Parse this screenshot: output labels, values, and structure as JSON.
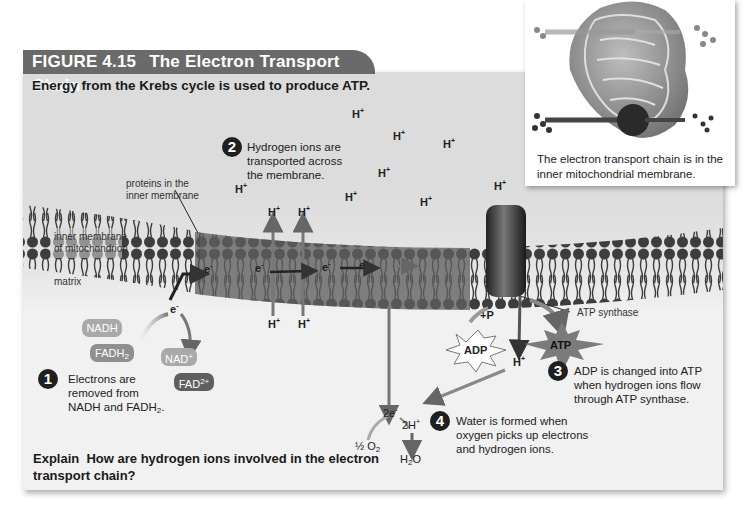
{
  "figure": {
    "number": "FIGURE 4.15",
    "title": "The Electron Transport Chain",
    "subtitle": "Energy from the Krebs cycle is used to produce ATP.",
    "header_color": "#6a6a6a",
    "panel_color_top": "#dcdcdc",
    "panel_color_bottom": "#f1f1f1"
  },
  "inset": {
    "caption_line1": "The electron transport chain is in the",
    "caption_line2": "inner mitochondrial membrane."
  },
  "labels": {
    "proteins_line1": "proteins in the",
    "proteins_line2": "inner membrane",
    "inner_membrane_line1": "inner membrane",
    "inner_membrane_line2": "of mitochondrion",
    "matrix": "matrix",
    "atp_synthase": "ATP synthase",
    "h_ion": "H",
    "h_charge": "+",
    "electron": "e",
    "electron_charge": "-",
    "adp": "ADP",
    "atp": "ATP",
    "plus_p": "+P",
    "two_e": "2e",
    "two_h": "2H",
    "half": "½",
    "o2": "O",
    "o2_sub": "2",
    "h2o_h": "H",
    "h2o_sub": "2",
    "h2o_o": "O"
  },
  "molecules": {
    "nadh": {
      "label": "NADH",
      "color": "#a9a9a9"
    },
    "fadh2": {
      "label": "FADH",
      "sub": "2",
      "color": "#8f8f8f"
    },
    "nad": {
      "label": "NAD",
      "sup": "+",
      "color": "#a9a9a9"
    },
    "fad": {
      "label": "FAD",
      "sup": "2+",
      "color": "#5f5f5f"
    }
  },
  "steps": [
    {
      "num": "1",
      "lines": [
        "Electrons are",
        "removed from",
        "NADH and FADH"
      ],
      "line3_sub": "2",
      "line3_end": "."
    },
    {
      "num": "2",
      "lines": [
        "Hydrogen ions are",
        "transported across",
        "the membrane."
      ]
    },
    {
      "num": "3",
      "lines": [
        "ADP is changed into ATP",
        "when hydrogen ions flow",
        "through ATP synthase."
      ]
    },
    {
      "num": "4",
      "lines": [
        "Water is formed when",
        "oxygen picks up electrons",
        "and hydrogen ions."
      ]
    }
  ],
  "explain": {
    "label": "Explain",
    "question": "How are hydrogen ions involved in the electron transport chain?"
  }
}
